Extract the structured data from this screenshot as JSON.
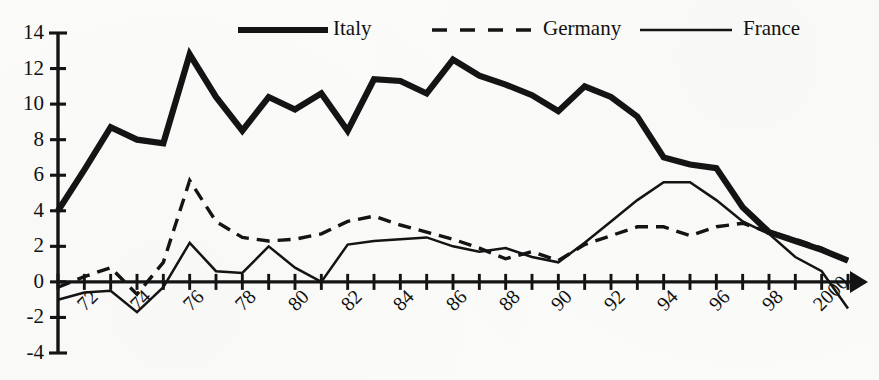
{
  "chart_data": {
    "type": "line",
    "title": "",
    "subtitle": "",
    "xlabel": "",
    "ylabel": "",
    "xlim": [
      1971,
      2001
    ],
    "ylim": [
      -4,
      14
    ],
    "yticks": [
      -4,
      -2,
      0,
      2,
      4,
      6,
      8,
      10,
      12,
      14
    ],
    "ytick_labels": [
      "-4",
      "-2",
      "0",
      "2",
      "4",
      "6",
      "8",
      "10",
      "12",
      "14"
    ],
    "xticks": [
      1971,
      1972,
      1973,
      1974,
      1975,
      1976,
      1977,
      1978,
      1979,
      1980,
      1981,
      1982,
      1983,
      1984,
      1985,
      1986,
      1987,
      1988,
      1989,
      1990,
      1991,
      1992,
      1993,
      1994,
      1995,
      1996,
      1997,
      1998,
      1999,
      2000,
      2001
    ],
    "xtick_labels": [
      "72",
      "74",
      "76",
      "78",
      "80",
      "82",
      "84",
      "86",
      "88",
      "90",
      "92",
      "94",
      "96",
      "98",
      "2000"
    ],
    "xtick_label_years": [
      1972,
      1974,
      1976,
      1978,
      1980,
      1982,
      1984,
      1986,
      1988,
      1990,
      1992,
      1994,
      1996,
      1998,
      2000
    ],
    "xtick_label_rotation_deg": -45,
    "grid": false,
    "legend_position": "top-center",
    "x": [
      1971,
      1972,
      1973,
      1974,
      1975,
      1976,
      1977,
      1978,
      1979,
      1980,
      1981,
      1982,
      1983,
      1984,
      1985,
      1986,
      1987,
      1988,
      1989,
      1990,
      1991,
      1992,
      1993,
      1994,
      1995,
      1996,
      1997,
      1998,
      1999,
      2000,
      2001
    ],
    "series": [
      {
        "name": "Italy",
        "style": "thick-solid",
        "color": "#141414",
        "values": [
          4.0,
          6.3,
          8.7,
          8.0,
          7.8,
          12.8,
          10.4,
          8.5,
          10.4,
          9.7,
          10.6,
          8.5,
          11.4,
          11.3,
          10.6,
          12.5,
          11.6,
          11.1,
          10.5,
          9.6,
          11.0,
          10.4,
          9.3,
          7.0,
          6.6,
          6.4,
          4.2,
          2.8,
          2.3,
          1.8,
          1.2
        ]
      },
      {
        "name": "Germany",
        "style": "dashed",
        "color": "#141414",
        "values": [
          -0.3,
          0.3,
          0.8,
          -0.7,
          1.1,
          5.7,
          3.4,
          2.5,
          2.3,
          2.4,
          2.7,
          3.4,
          3.7,
          3.2,
          2.8,
          2.4,
          1.9,
          1.3,
          1.7,
          1.2,
          2.1,
          2.6,
          3.1,
          3.1,
          2.6,
          3.1,
          3.3,
          2.8,
          2.4,
          1.9,
          1.2
        ]
      },
      {
        "name": "France",
        "style": "thin-solid",
        "color": "#141414",
        "values": [
          -1.0,
          -0.6,
          -0.5,
          -1.7,
          -0.3,
          2.2,
          0.6,
          0.5,
          2.0,
          0.8,
          0.0,
          2.1,
          2.3,
          2.4,
          2.5,
          2.0,
          1.7,
          1.9,
          1.4,
          1.1,
          2.2,
          3.4,
          4.6,
          5.6,
          5.6,
          4.6,
          3.4,
          2.7,
          1.4,
          0.6,
          -1.5
        ]
      }
    ]
  },
  "legend": {
    "items": [
      {
        "label": "Italy",
        "style": "thick-solid"
      },
      {
        "label": "Germany",
        "style": "dashed"
      },
      {
        "label": "France",
        "style": "thin-solid"
      }
    ]
  }
}
